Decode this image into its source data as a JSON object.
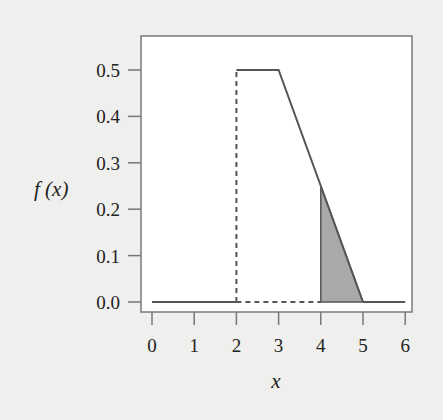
{
  "chart_data": {
    "type": "line",
    "title": "",
    "xlabel": "x",
    "ylabel": "f (x)",
    "xlim": [
      0,
      6
    ],
    "ylim": [
      0,
      0.5
    ],
    "x_ticks": [
      0,
      1,
      2,
      3,
      4,
      5,
      6
    ],
    "x_tick_labels": [
      "0",
      "1",
      "2",
      "3",
      "4",
      "5",
      "6"
    ],
    "y_ticks": [
      0.0,
      0.1,
      0.2,
      0.3,
      0.4,
      0.5
    ],
    "y_tick_labels": [
      "0.0",
      "0.1",
      "0.2",
      "0.3",
      "0.4",
      "0.5"
    ],
    "grid": false,
    "series": [
      {
        "name": "density-left-zero",
        "style": "solid",
        "points": [
          [
            0,
            0
          ],
          [
            2,
            0
          ]
        ]
      },
      {
        "name": "density-jump",
        "style": "dashed",
        "points": [
          [
            2,
            0
          ],
          [
            2,
            0.5
          ]
        ]
      },
      {
        "name": "density-main",
        "style": "solid",
        "points": [
          [
            2,
            0.5
          ],
          [
            3,
            0.5
          ],
          [
            5,
            0
          ]
        ]
      },
      {
        "name": "density-right-zero",
        "style": "solid",
        "points": [
          [
            5,
            0
          ],
          [
            6,
            0
          ]
        ]
      },
      {
        "name": "baseline-dashed",
        "style": "dashed",
        "points": [
          [
            2,
            0
          ],
          [
            4,
            0
          ]
        ]
      }
    ],
    "shaded_region": {
      "x_from": 4,
      "x_to": 5,
      "points": [
        [
          4,
          0
        ],
        [
          4,
          0.25
        ],
        [
          5,
          0
        ]
      ],
      "color": "#a9a9a9"
    },
    "colors": {
      "line": "#555555",
      "frame": "#777777",
      "background": "#ffffff"
    }
  }
}
